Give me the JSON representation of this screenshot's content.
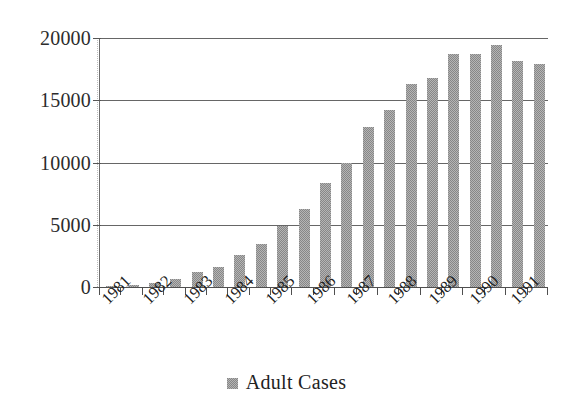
{
  "chart_data": {
    "type": "bar",
    "title": "",
    "xlabel": "",
    "ylabel": "",
    "ylim": [
      0,
      20000
    ],
    "yticks": [
      0,
      5000,
      10000,
      15000,
      20000
    ],
    "ytick_labels": [
      "0",
      "5000",
      "10000",
      "15000",
      "20000"
    ],
    "grid": true,
    "legend_position": "bottom",
    "categories": [
      "1981",
      "1982",
      "1983",
      "1984",
      "1985",
      "1986",
      "1987",
      "1988",
      "1989",
      "1990",
      "1991"
    ],
    "series": [
      {
        "name": "Adult Cases",
        "color": "#878787",
        "x": [
          "1981-H1",
          "1981-H2",
          "1982-H1",
          "1982-H2",
          "1983-H1",
          "1983-H2",
          "1984-H1",
          "1984-H2",
          "1985-H1",
          "1985-H2",
          "1986-H1",
          "1986-H2",
          "1987-H1",
          "1987-H2",
          "1988-H1",
          "1988-H2",
          "1989-H1",
          "1989-H2",
          "1990-H1",
          "1990-H2",
          "1991-H1"
        ],
        "values": [
          60,
          150,
          320,
          620,
          1200,
          1600,
          2550,
          3450,
          4900,
          6250,
          8350,
          10000,
          12850,
          14200,
          16300,
          16800,
          18750,
          18700,
          19450,
          18150,
          17950
        ]
      }
    ]
  },
  "axis": {
    "y_tick_labels": [
      "20000",
      "15000",
      "10000",
      "5000",
      "0"
    ],
    "x_tick_labels": [
      "1981",
      "1982",
      "1983",
      "1984",
      "1985",
      "1986",
      "1987",
      "1988",
      "1989",
      "1990",
      "1991"
    ]
  },
  "legend": {
    "label": "Adult Cases",
    "swatch_color": "#878787"
  },
  "colors": {
    "bar": "#878787",
    "gridline": "#666666",
    "axis": "#4f4f4f",
    "text": "#222222",
    "background": "#ffffff"
  }
}
